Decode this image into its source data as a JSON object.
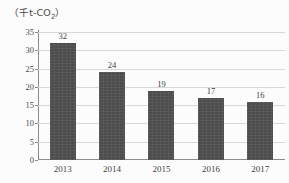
{
  "unit_label": {
    "prefix": "（千t-CO",
    "subscript": "2",
    "suffix": "）"
  },
  "chart_data": {
    "type": "bar",
    "title": "",
    "subtitle": "",
    "xlabel": "",
    "ylabel": "（千t-CO2）",
    "categories": [
      "2013",
      "2014",
      "2015",
      "2016",
      "2017"
    ],
    "values": [
      32,
      24,
      19,
      17,
      16
    ],
    "data_labels": [
      "32",
      "24",
      "19",
      "17",
      "16"
    ],
    "ylim": [
      0,
      35
    ],
    "ytick_labels": [
      "0",
      "5",
      "10",
      "15",
      "20",
      "25",
      "30",
      "35"
    ],
    "ytick_values": [
      0,
      5,
      10,
      15,
      20,
      25,
      30,
      35
    ],
    "grid": true,
    "grid_axis": "y",
    "legend": false,
    "legend_position": "none",
    "colors": {
      "bar": "#4d4d4d",
      "gridline": "#d8d8d8",
      "axis": "#8c8c8c",
      "text": "#3f3f3f",
      "background": "#fdfdfd"
    }
  }
}
